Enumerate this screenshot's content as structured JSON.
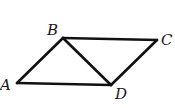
{
  "diagram": {
    "type": "geometry-figure",
    "stroke_color": "#111111",
    "points": {
      "A": {
        "label": "A",
        "x": 17,
        "y": 83
      },
      "B": {
        "label": "B",
        "x": 63,
        "y": 38
      },
      "C": {
        "label": "C",
        "x": 157,
        "y": 40
      },
      "D": {
        "label": "D",
        "x": 111,
        "y": 85
      }
    },
    "segments": [
      {
        "from": "A",
        "to": "B"
      },
      {
        "from": "B",
        "to": "C"
      },
      {
        "from": "C",
        "to": "D"
      },
      {
        "from": "D",
        "to": "A"
      },
      {
        "from": "B",
        "to": "D"
      }
    ],
    "labels": {
      "A": "A",
      "B": "B",
      "C": "C",
      "D": "D"
    }
  }
}
